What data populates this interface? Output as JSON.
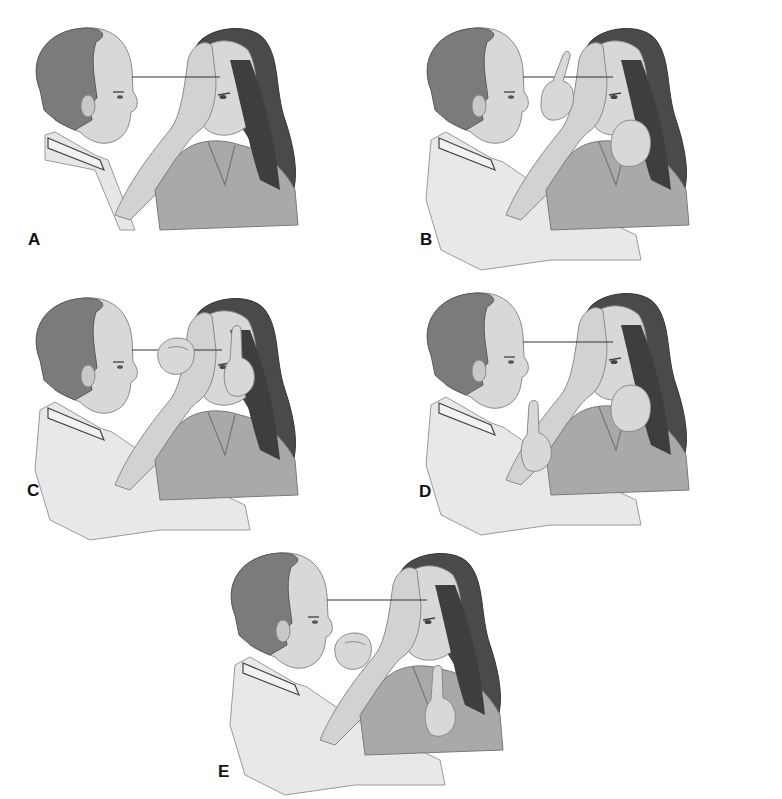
{
  "figure": {
    "colors": {
      "background": "#ffffff",
      "hair_man": "#7b7b7b",
      "skin": "#d6d6d6",
      "coat": "#e6e6e6",
      "hair_woman": "#4a4a4a",
      "shirt_woman": "#a9a9a9",
      "sight_line": "#333333",
      "outline": "#8a8a8a"
    },
    "panels": [
      {
        "label": "A",
        "examiner_hands": "none"
      },
      {
        "label": "B",
        "examiner_hands": "one hand raised pointing upward, other hand near patient's face"
      },
      {
        "label": "C",
        "examiner_hands": "fist raised near sight line, index finger raised beside patient's face"
      },
      {
        "label": "D",
        "examiner_hands": "finger raised low at chest, other hand near patient's face"
      },
      {
        "label": "E",
        "examiner_hands": "fist raised at chin level, finger raised low beside patient"
      }
    ]
  }
}
